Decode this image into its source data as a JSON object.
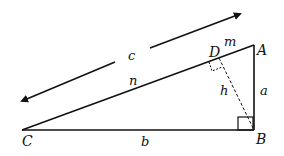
{
  "diagram": {
    "colors": {
      "stroke": "#111111",
      "background": "#ffffff"
    },
    "vertices": {
      "A": {
        "label": "A",
        "x": 254,
        "y": 45
      },
      "B": {
        "label": "B",
        "x": 254,
        "y": 130
      },
      "C": {
        "label": "C",
        "x": 22,
        "y": 130
      },
      "D": {
        "label": "D",
        "x": 218,
        "y": 58
      }
    },
    "segment_labels": {
      "a": "a",
      "b": "b",
      "c": "c",
      "h": "h",
      "m": "m",
      "n": "n"
    },
    "right_angles": [
      "B",
      "D"
    ],
    "dimension_arrow": {
      "label": "c",
      "spans": "hypotenuse CA",
      "double_headed": true
    }
  }
}
